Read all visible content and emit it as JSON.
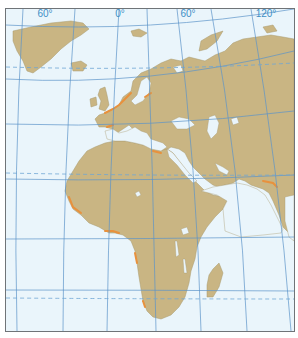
{
  "map": {
    "title": "",
    "longitude_labels": [
      {
        "label": "60°",
        "x": 40
      },
      {
        "label": "0°",
        "x": 118
      },
      {
        "label": "60°",
        "x": 190
      },
      {
        "label": "120°",
        "x": 268
      }
    ],
    "colors": {
      "ocean": "#eaf5fb",
      "land": "#c9b583",
      "land_stroke": "#a89a6f",
      "graticule": "#5b93c8",
      "dashed_lines": "#6ea6d4",
      "coast_highlight": "#e8913d",
      "frame": "#6f7478",
      "label": "#3d8fc6"
    },
    "regions": [
      "Greenland",
      "Iceland",
      "Europe",
      "Africa",
      "Arabian Peninsula",
      "Asia",
      "Madagascar",
      "Indian subcontinent"
    ],
    "special_lines": [
      "Arctic Circle (dashed)",
      "Tropic of Cancer (dashed)",
      "Tropic of Capricorn (dashed)"
    ]
  }
}
